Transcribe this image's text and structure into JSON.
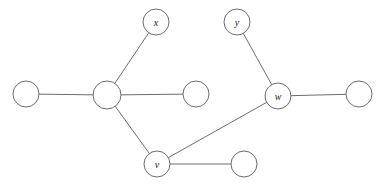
{
  "figure": {
    "name": "undirected-graph-diagram",
    "background_color": "#ffffff",
    "stroke_color": "#6d6d6d",
    "label_color": "#1a1a1a",
    "width": 387,
    "height": 184
  },
  "graph": {
    "type": "undirected",
    "node_radius": 13,
    "node_count": 9,
    "edge_count": 8,
    "nodes": [
      {
        "id": "n1",
        "label": "",
        "cx": 26,
        "cy": 94,
        "r": 13,
        "labeled": false
      },
      {
        "id": "hub",
        "label": "",
        "cx": 107,
        "cy": 95,
        "r": 14,
        "labeled": false
      },
      {
        "id": "x",
        "label": "x",
        "cx": 156,
        "cy": 22,
        "r": 13,
        "labeled": true
      },
      {
        "id": "n3",
        "label": "",
        "cx": 196,
        "cy": 94,
        "r": 13,
        "labeled": false
      },
      {
        "id": "y",
        "label": "y",
        "cx": 237,
        "cy": 22,
        "r": 13,
        "labeled": true
      },
      {
        "id": "w",
        "label": "w",
        "cx": 278,
        "cy": 96,
        "r": 13,
        "labeled": true
      },
      {
        "id": "n5",
        "label": "",
        "cx": 359,
        "cy": 94,
        "r": 13,
        "labeled": false
      },
      {
        "id": "v",
        "label": "v",
        "cx": 157,
        "cy": 164,
        "r": 13,
        "labeled": true
      },
      {
        "id": "n6",
        "label": "",
        "cx": 244,
        "cy": 164,
        "r": 13,
        "labeled": false
      }
    ],
    "edges": [
      {
        "id": "e1",
        "from": "n1",
        "to": "hub"
      },
      {
        "id": "e2",
        "from": "hub",
        "to": "x"
      },
      {
        "id": "e3",
        "from": "hub",
        "to": "n3"
      },
      {
        "id": "e4",
        "from": "hub",
        "to": "v"
      },
      {
        "id": "e5",
        "from": "y",
        "to": "w"
      },
      {
        "id": "e6",
        "from": "w",
        "to": "n5"
      },
      {
        "id": "e7",
        "from": "w",
        "to": "v"
      },
      {
        "id": "e8",
        "from": "v",
        "to": "n6"
      }
    ]
  }
}
